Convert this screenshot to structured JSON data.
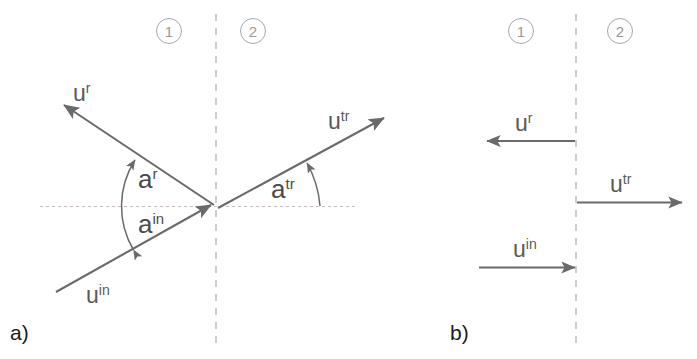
{
  "figure": {
    "background_color": "#ffffff",
    "line_color": "#6a6a6a",
    "dashed_color": "#bdbdbd",
    "axis_color": "#c9bfbf",
    "badge_color": "#a8a8a8",
    "label_color": "#5a5a5a"
  },
  "panels": [
    {
      "id": "panel-a",
      "caption": "a)",
      "regions": [
        {
          "name": "region-1",
          "label": "1"
        },
        {
          "name": "region-2",
          "label": "2"
        }
      ],
      "vectors": [
        {
          "name": "reflected-wave",
          "base": "u",
          "superscript": "r"
        },
        {
          "name": "transmitted-wave",
          "base": "u",
          "superscript": "tr"
        },
        {
          "name": "incident-wave",
          "base": "u",
          "superscript": "in"
        }
      ],
      "angles": [
        {
          "name": "reflection-angle",
          "base": "a",
          "superscript": "r"
        },
        {
          "name": "incidence-angle",
          "base": "a",
          "superscript": "in"
        },
        {
          "name": "transmission-angle",
          "base": "a",
          "superscript": "tr"
        }
      ]
    },
    {
      "id": "panel-b",
      "caption": "b)",
      "regions": [
        {
          "name": "region-1",
          "label": "1"
        },
        {
          "name": "region-2",
          "label": "2"
        }
      ],
      "vectors": [
        {
          "name": "reflected-wave",
          "base": "u",
          "superscript": "r"
        },
        {
          "name": "transmitted-wave",
          "base": "u",
          "superscript": "tr"
        },
        {
          "name": "incident-wave",
          "base": "u",
          "superscript": "in"
        }
      ]
    }
  ],
  "labels": {
    "a_region1": "1",
    "a_region2": "2",
    "a_u_r_base": "u",
    "a_u_r_sup": "r",
    "a_u_tr_base": "u",
    "a_u_tr_sup": "tr",
    "a_u_in_base": "u",
    "a_u_in_sup": "in",
    "a_ang_r_base": "a",
    "a_ang_r_sup": "r",
    "a_ang_in_base": "a",
    "a_ang_in_sup": "in",
    "a_ang_tr_base": "a",
    "a_ang_tr_sup": "tr",
    "a_caption": "a)",
    "b_region1": "1",
    "b_region2": "2",
    "b_u_r_base": "u",
    "b_u_r_sup": "r",
    "b_u_tr_base": "u",
    "b_u_tr_sup": "tr",
    "b_u_in_base": "u",
    "b_u_in_sup": "in",
    "b_caption": "b)"
  }
}
